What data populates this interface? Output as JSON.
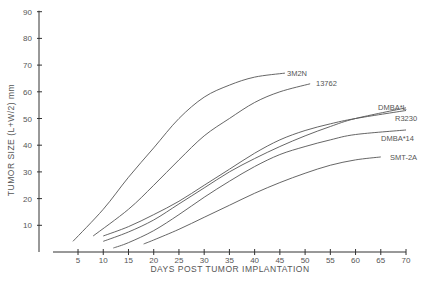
{
  "chart_data": {
    "type": "line",
    "title": "",
    "xlabel": "DAYS POST TUMOR IMPLANTATION",
    "ylabel": "TUMOR SIZE (L+W/2) mm",
    "xlim": [
      0,
      70
    ],
    "ylim": [
      0,
      90
    ],
    "xticks": [
      5,
      10,
      15,
      20,
      25,
      30,
      35,
      40,
      45,
      50,
      55,
      60,
      65,
      70
    ],
    "yticks": [
      10,
      20,
      30,
      40,
      50,
      60,
      70,
      80,
      90
    ],
    "grid": false,
    "legend": "inline labels at curve ends",
    "series": [
      {
        "name": "3M2N",
        "x": [
          4,
          10,
          15,
          20,
          25,
          30,
          35,
          40,
          46
        ],
        "y": [
          4,
          16,
          28,
          39,
          50,
          58,
          62.5,
          65.5,
          67
        ]
      },
      {
        "name": "13762",
        "x": [
          8,
          15,
          20,
          25,
          30,
          35,
          40,
          45,
          51
        ],
        "y": [
          6,
          16,
          25,
          34.5,
          43.5,
          50,
          56,
          60,
          63
        ]
      },
      {
        "name": "DMBA*L",
        "x": [
          10,
          15,
          20,
          25,
          30,
          35,
          40,
          45,
          50,
          55,
          60,
          70
        ],
        "y": [
          4,
          7.5,
          12,
          18,
          24,
          30,
          35,
          39.5,
          43.5,
          47,
          50,
          54
        ]
      },
      {
        "name": "R3230",
        "x": [
          10,
          15,
          20,
          25,
          30,
          35,
          40,
          45,
          50,
          55,
          60,
          70
        ],
        "y": [
          6,
          9.5,
          14,
          19,
          25,
          31,
          37,
          42,
          45.5,
          48,
          50,
          53
        ]
      },
      {
        "name": "DMBA*14",
        "x": [
          12,
          15,
          20,
          25,
          30,
          35,
          40,
          45,
          50,
          55,
          60,
          70
        ],
        "y": [
          1.5,
          3.5,
          8,
          14,
          20.5,
          26.5,
          32,
          36.5,
          39.5,
          42,
          44,
          45.7
        ]
      },
      {
        "name": "SMT-2A",
        "x": [
          18,
          20,
          25,
          30,
          35,
          40,
          45,
          50,
          55,
          60,
          65
        ],
        "y": [
          3,
          4.5,
          8.5,
          13,
          17.5,
          22,
          26,
          29.5,
          32.5,
          34.5,
          35.6
        ]
      }
    ]
  }
}
